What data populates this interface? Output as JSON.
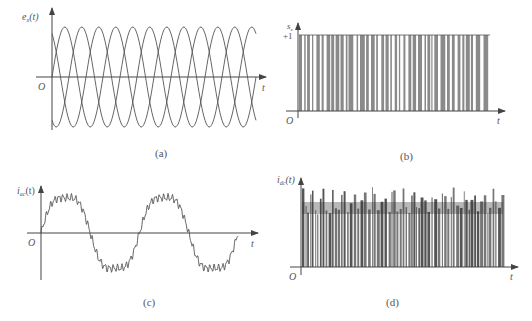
{
  "figure": {
    "panels": [
      {
        "id": "a",
        "caption": "(a)",
        "ylabel_main": "e",
        "ylabel_sub": "x",
        "ylabel_arg": "(t)",
        "xlabel": "t",
        "origin": "O"
      },
      {
        "id": "b",
        "caption": "(b)",
        "ylabel_main": "s",
        "ylabel_sub": "x",
        "ylabel_arg": "",
        "xlabel": "t",
        "origin": "O",
        "ytick": "+1"
      },
      {
        "id": "c",
        "caption": "(c)",
        "ylabel_main": "i",
        "ylabel_sub": "ac",
        "ylabel_arg": "(t)",
        "xlabel": "t",
        "origin": "O"
      },
      {
        "id": "d",
        "caption": "(d)",
        "ylabel_main": "i",
        "ylabel_sub": "dc",
        "ylabel_arg": "(t)",
        "xlabel": "t",
        "origin": "O"
      }
    ],
    "colors": {
      "line": "#555555",
      "axis": "#444444",
      "dense": "#666666"
    }
  },
  "chart_data": [
    {
      "panel": "a",
      "type": "line",
      "title": "",
      "xlabel": "t",
      "ylabel": "e_x(t)",
      "description": "Three-phase sinusoidal voltages, 120° apart, ~4 periods",
      "series": [
        {
          "name": "phase-1",
          "phase_deg": 0
        },
        {
          "name": "phase-2",
          "phase_deg": -120
        },
        {
          "name": "phase-3",
          "phase_deg": 120
        }
      ],
      "periods": 4,
      "amplitude": 1,
      "grid": false
    },
    {
      "panel": "b",
      "type": "line",
      "title": "",
      "xlabel": "t",
      "ylabel": "s_x",
      "description": "PWM switching function toggling between 0 and +1",
      "yticks": [
        "+1"
      ],
      "levels": [
        0,
        1
      ],
      "grid": false
    },
    {
      "panel": "c",
      "type": "line",
      "title": "",
      "xlabel": "t",
      "ylabel": "i_ac(t)",
      "description": "AC phase current: sinusoid with high-frequency ripple, ~2 periods",
      "periods": 2,
      "grid": false
    },
    {
      "panel": "d",
      "type": "line",
      "title": "",
      "xlabel": "t",
      "ylabel": "i_dc(t)",
      "description": "DC-link current: dense pulses with periodic peaks (~20 humps)",
      "peaks": 20,
      "grid": false
    }
  ]
}
